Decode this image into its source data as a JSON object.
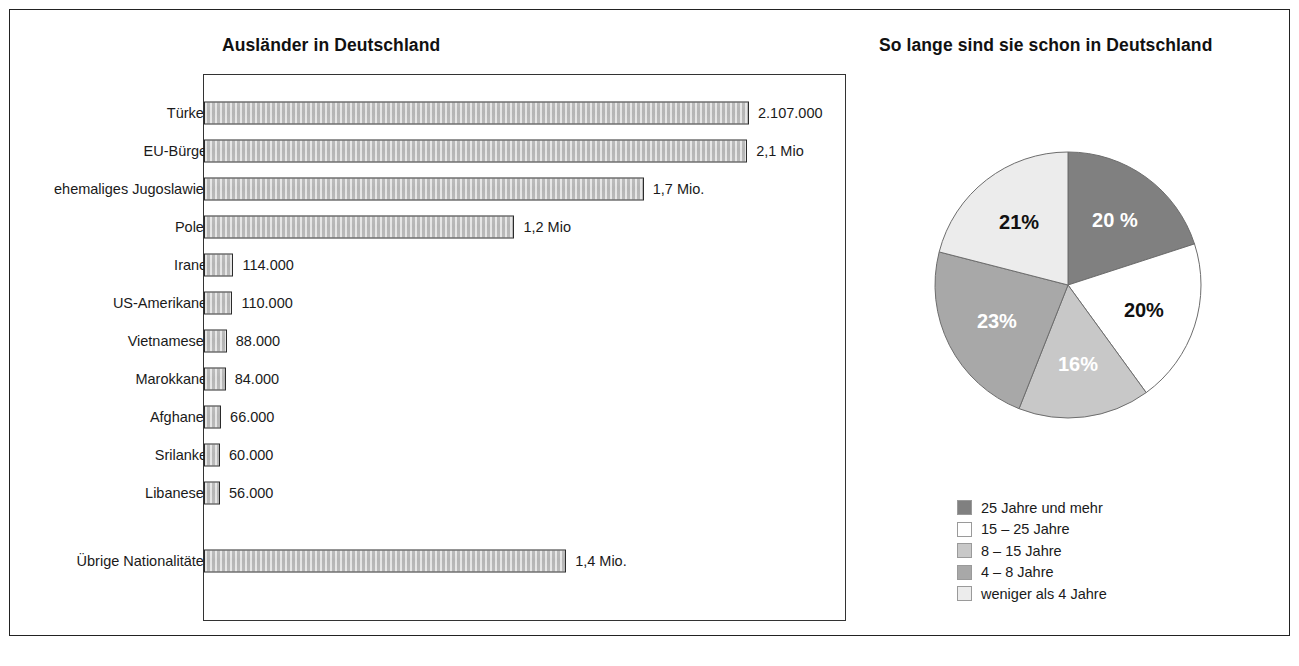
{
  "bar_panel": {
    "title": "Ausländer in Deutschland"
  },
  "pie_panel": {
    "title": "So lange sind sie schon in Deutschland"
  },
  "colors": {
    "bar_fill": "#c6c6c6",
    "bar_border": "#2b2b2b",
    "frame": "#222222",
    "slice_25_plus": "#808080",
    "slice_15_25": "#ffffff",
    "slice_8_15": "#c8c8c8",
    "slice_4_8": "#a8a8a8",
    "slice_under_4": "#ececec",
    "text": "#1a1a1a"
  },
  "chart_data": [
    {
      "type": "bar",
      "title": "Ausländer in Deutschland",
      "orientation": "horizontal",
      "xlabel": "",
      "ylabel": "",
      "grid": false,
      "legend": "none",
      "xlim": [
        0,
        2107000
      ],
      "categories": [
        "Türken",
        "EU-Bürger",
        "ehemaliges Jugoslawien",
        "Polen",
        "Iraner",
        "US-Amerikaner",
        "Vietnamesen",
        "Marokkaner",
        "Afghanen",
        "Srilanker",
        "Libanesen",
        "Übrige Nationalitäten"
      ],
      "values": [
        2107000,
        2100000,
        1700000,
        1200000,
        114000,
        110000,
        88000,
        84000,
        66000,
        60000,
        56000,
        1400000
      ],
      "value_labels": [
        "2.107.000",
        "2,1 Mio",
        "1,7 Mio.",
        "1,2 Mio",
        "114.000",
        "110.000",
        "88.000",
        "84.000",
        "66.000",
        "60.000",
        "56.000",
        "1,4 Mio."
      ]
    },
    {
      "type": "pie",
      "title": "So lange sind sie schon in Deutschland",
      "legend": "bottom-right",
      "labels": [
        "25 Jahre und mehr",
        "15 – 25 Jahre",
        "8 – 15 Jahre",
        "4 – 8 Jahre",
        "weniger als 4 Jahre"
      ],
      "values": [
        20,
        20,
        16,
        23,
        21
      ],
      "slice_labels": [
        "20 %",
        "20%",
        "16%",
        "23%",
        "21%"
      ],
      "slice_colors": [
        "#808080",
        "#ffffff",
        "#c8c8c8",
        "#a8a8a8",
        "#ececec"
      ],
      "slice_label_colors": [
        "#ffffff",
        "#111111",
        "#ffffff",
        "#ffffff",
        "#111111"
      ]
    }
  ]
}
